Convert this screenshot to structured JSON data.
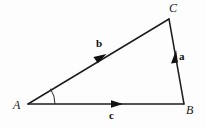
{
  "figure": {
    "kind": "vector-triangle-diagram",
    "background_color": "#fdfdfd",
    "stroke_color": "#1d1d1d",
    "vertices": {
      "A": {
        "label": "A",
        "x": 28,
        "y": 104
      },
      "B": {
        "label": "B",
        "x": 184,
        "y": 104
      },
      "C": {
        "label": "C",
        "x": 169,
        "y": 19
      }
    },
    "vectors": [
      {
        "name": "vector-a",
        "label": "a",
        "from": "B",
        "to": "C",
        "arrow_at": {
          "x": 175,
          "y": 58
        },
        "label_pos": {
          "x": 179,
          "y": 51
        }
      },
      {
        "name": "vector-b",
        "label": "b",
        "from": "A",
        "to": "C",
        "arrow_at": {
          "x": 100,
          "y": 58
        },
        "label_pos": {
          "x": 96,
          "y": 38
        }
      },
      {
        "name": "vector-c",
        "label": "c",
        "from": "A",
        "to": "B",
        "arrow_at": {
          "x": 117,
          "y": 104
        },
        "label_pos": {
          "x": 109,
          "y": 110
        }
      }
    ],
    "angle_mark": {
      "at_vertex": "A",
      "radius": 27,
      "between": [
        "c",
        "b"
      ]
    }
  }
}
